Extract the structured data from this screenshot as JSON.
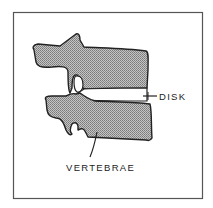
{
  "diagram": {
    "labels": {
      "disk": "DISK",
      "vertebrae": "VERTEBRAE"
    },
    "colors": {
      "outline": "#222222",
      "bone_fill": "#9a9a9a",
      "frame": "#555555",
      "background": "#ffffff"
    }
  }
}
